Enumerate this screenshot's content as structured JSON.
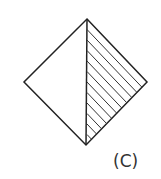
{
  "figure": {
    "label": "(C)",
    "shape": "diamond",
    "stroke_color": "#222222",
    "vertices": {
      "top": [
        87,
        19
      ],
      "right": [
        147,
        82
      ],
      "bottom": [
        86,
        145
      ],
      "left": [
        24,
        82
      ]
    },
    "divider": "vertical line from top to bottom vertex",
    "hatched_half": "right",
    "hatch_line_count": 11
  }
}
